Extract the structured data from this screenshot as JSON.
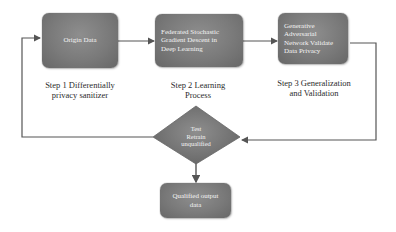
{
  "diagram": {
    "nodes": [
      {
        "id": "origin",
        "shape": "rounded-rect",
        "text": "Origin Data"
      },
      {
        "id": "fsgd",
        "shape": "rounded-rect",
        "text": "Federated Stochastic Gradient Descent in Deep Learning"
      },
      {
        "id": "gan",
        "shape": "rounded-rect",
        "text": "Generative Adversarial Network Validate Data Privacy"
      },
      {
        "id": "decision",
        "shape": "diamond",
        "text": "Test Retrain unqualified"
      },
      {
        "id": "output",
        "shape": "rounded-rect",
        "text": "Qualified output data"
      }
    ],
    "steps": [
      {
        "line1": "Step 1 Differentially",
        "line2": "privacy sanitizer"
      },
      {
        "line1": "Step 2 Learning",
        "line2": "Process"
      },
      {
        "line1": "Step 3 Generalization",
        "line2": "and Validation"
      }
    ],
    "edges": [
      {
        "from": "origin",
        "to": "fsgd"
      },
      {
        "from": "fsgd",
        "to": "gan"
      },
      {
        "from": "gan",
        "to": "decision"
      },
      {
        "from": "decision",
        "to": "origin"
      },
      {
        "from": "decision",
        "to": "output"
      }
    ],
    "box_text": {
      "origin": "Origin Data",
      "fsgd_l1": "Federated Stochastic",
      "fsgd_l2": "Gradient Descent in",
      "fsgd_l3": "Deep Learning",
      "gan_l1": "Generative",
      "gan_l2": "Adversarial",
      "gan_l3": "Network Validate",
      "gan_l4": "Data Privacy",
      "dec_l1": "Test",
      "dec_l2": "Retrain",
      "dec_l3": "unqualified",
      "out_l1": "Qualified output",
      "out_l2": "data"
    },
    "colors": {
      "box_fill": "#7a7a7a",
      "line": "#555555",
      "text_light": "#f4f4f4",
      "label_text": "#2b2b2b"
    }
  }
}
